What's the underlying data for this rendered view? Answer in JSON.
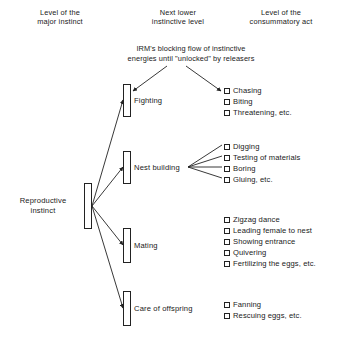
{
  "headers": {
    "major": [
      "Level of the",
      "major instinct"
    ],
    "next": [
      "Next lower",
      "instinctive level"
    ],
    "consummatory": [
      "Level of the",
      "consummatory act"
    ]
  },
  "irm_note": [
    "IRM's blocking flow of instinctive",
    "energies until \"unlocked\" by releasers"
  ],
  "root": {
    "label_lines": [
      "Reproductive",
      "instinct"
    ]
  },
  "branches": [
    {
      "label": "Fighting",
      "acts": [
        "Chasing",
        "Biting",
        "Threatening, etc."
      ]
    },
    {
      "label": "Nest building",
      "acts": [
        "Digging",
        "Testing of materials",
        "Boring",
        "Gluing, etc."
      ]
    },
    {
      "label": "Mating",
      "acts": [
        "Zigzag dance",
        "Leading female to nest",
        "Showing entrance",
        "Quivering",
        "Fertilizing the eggs, etc."
      ]
    },
    {
      "label": "Care of offspring",
      "acts": [
        "Fanning",
        "Rescuing eggs, etc."
      ]
    }
  ],
  "colors": {
    "background": "#ffffff",
    "text": "#1a1a1a",
    "stroke": "#222222"
  }
}
